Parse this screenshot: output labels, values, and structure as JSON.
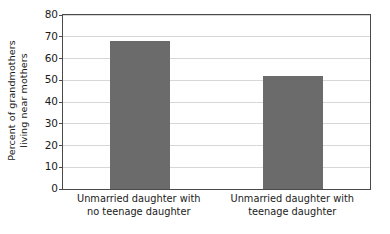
{
  "chart_data": {
    "type": "bar",
    "title": "",
    "xlabel": "",
    "ylabel": "Percent of grandmothers living near mothers",
    "ylabel_lines": [
      "Percent of grandmothers",
      "living near mothers"
    ],
    "categories": [
      "Unmarried daughter with no teenage daughter",
      "Unmarried daughter with teenage daughter"
    ],
    "category_lines": [
      [
        "Unmarried daughter with",
        "no teenage daughter"
      ],
      [
        "Unmarried daughter with",
        "teenage daughter"
      ]
    ],
    "values": [
      68,
      52
    ],
    "ylim": [
      0,
      80
    ],
    "yticks": [
      0,
      10,
      20,
      30,
      40,
      50,
      60,
      70,
      80
    ],
    "ytick_labels": [
      "0",
      "10",
      "20",
      "30",
      "40",
      "50",
      "60",
      "70",
      "80"
    ],
    "grid": true,
    "legend": "none",
    "bar_color": "#6b6b6b",
    "grid_color": "#d7d7d7",
    "axis_color": "#4a4a4a",
    "background_color": "#ffffff"
  }
}
